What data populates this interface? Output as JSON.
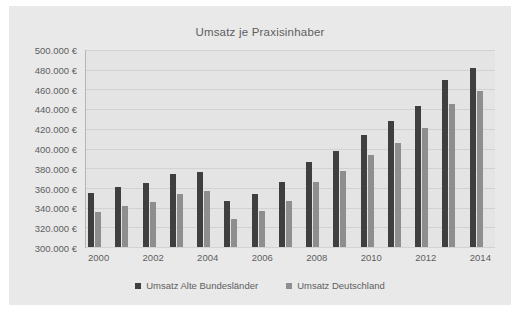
{
  "chart_data": {
    "type": "bar",
    "title": "Umsatz je Praxisinhaber",
    "xlabel": "",
    "ylabel": "",
    "ylim": [
      300000,
      500000
    ],
    "ytick_step": 20000,
    "grid": true,
    "legend_position": "bottom",
    "currency_suffix": " €",
    "categories": [
      2000,
      2001,
      2002,
      2003,
      2004,
      2005,
      2006,
      2007,
      2008,
      2009,
      2010,
      2011,
      2012,
      2013,
      2014
    ],
    "xtick_labels": [
      "2000",
      "2002",
      "2004",
      "2006",
      "2008",
      "2010",
      "2012",
      "2014"
    ],
    "ytick_labels": [
      "500.000 €",
      "480.000 €",
      "460.000 €",
      "440.000 €",
      "420.000 €",
      "400.000 €",
      "380.000 €",
      "360.000 €",
      "340.000 €",
      "320.000 €",
      "300.000 €"
    ],
    "ytick_values": [
      500000,
      480000,
      460000,
      440000,
      420000,
      400000,
      380000,
      360000,
      340000,
      320000,
      300000
    ],
    "series": [
      {
        "name": "Umsatz Alte Bundesländer",
        "color": "#3f3f3f",
        "values": [
          355000,
          361000,
          365000,
          374000,
          376000,
          347000,
          354000,
          366000,
          386000,
          397000,
          414000,
          428000,
          443000,
          470000,
          482000
        ]
      },
      {
        "name": "Umsatz Deutschland",
        "color": "#8e8e8e",
        "values": [
          336000,
          342000,
          346000,
          354000,
          357000,
          328000,
          337000,
          347000,
          366000,
          377000,
          393000,
          406000,
          421000,
          445000,
          458000
        ]
      }
    ]
  },
  "legend": {
    "items": [
      {
        "label": "Umsatz Alte Bundesländer",
        "color": "#3f3f3f"
      },
      {
        "label": "Umsatz Deutschland",
        "color": "#8e8e8e"
      }
    ]
  },
  "colors": {
    "page_background": "#ffffff",
    "card_background": "#e9e9e9",
    "plot_background": "#e4e4e4",
    "gridline": "#d2d2d2",
    "axis_line": "#b6b6b6",
    "text": "#5e5e5e",
    "series_dark": "#3f3f3f",
    "series_gray": "#8e8e8e"
  }
}
